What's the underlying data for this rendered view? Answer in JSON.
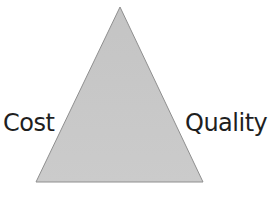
{
  "diagram": {
    "type": "triangle",
    "fill_color": "#c8c8c8",
    "stroke_color": "#9a9a9a",
    "labels": {
      "left": "Cost",
      "right": "Quality"
    }
  }
}
